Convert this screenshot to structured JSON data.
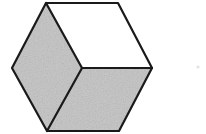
{
  "image": {
    "title": "Shaded cube (Necker cube) line drawing",
    "width": 206,
    "height": 134,
    "background_color": "#ffffff",
    "alt_text": "Hexagonal outline of a cube drawn in isometric projection; the top face is white and the two lower faces are light gray."
  },
  "figure": {
    "name": "cube",
    "stroke_color": "#1a1a1a",
    "stroke_width": 2.2,
    "outline_points": "46,3 118,3 152,68 119,131 47,131 12,68",
    "vertices": {
      "top_left": {
        "x": 46,
        "y": 3
      },
      "top_right": {
        "x": 118,
        "y": 3
      },
      "right": {
        "x": 152,
        "y": 68
      },
      "bottom_right": {
        "x": 119,
        "y": 131
      },
      "bottom_left": {
        "x": 47,
        "y": 131
      },
      "left": {
        "x": 12,
        "y": 68
      },
      "center": {
        "x": 82,
        "y": 68
      }
    },
    "faces": [
      {
        "name": "top-face",
        "label": "top",
        "fill_color": "#ffffff",
        "points": "46,3 118,3 152,68 82,68"
      },
      {
        "name": "left-face",
        "label": "left",
        "fill_color": "#c9c9c9",
        "points": "46,3 82,68 47,131 12,68"
      },
      {
        "name": "right-face",
        "label": "right",
        "fill_color": "#c9c9c9",
        "points": "82,68 152,68 119,131 47,131"
      }
    ],
    "internal_edges": [
      {
        "name": "edge-center-to-top-left",
        "x1": 46,
        "y1": 3,
        "x2": 82,
        "y2": 68
      },
      {
        "name": "edge-center-to-right",
        "x1": 82,
        "y1": 68,
        "x2": 152,
        "y2": 68
      },
      {
        "name": "edge-center-to-bottom-left",
        "x1": 82,
        "y1": 68,
        "x2": 47,
        "y2": 131
      }
    ]
  },
  "artifacts": {
    "speck": {
      "name": "scan-speck",
      "x": 198,
      "y": 67,
      "radius": 1.6,
      "color": "#e3e3e3"
    }
  }
}
